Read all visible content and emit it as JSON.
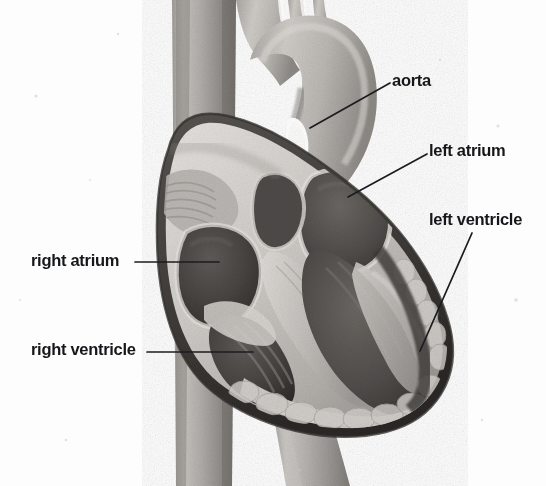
{
  "figure": {
    "kind": "anatomical-illustration",
    "style": "grayscale halftone scan",
    "background_color": "#fdfdfd",
    "text_color": "#16171a",
    "leader_line_color": "#1b1c1f"
  },
  "labels": [
    {
      "id": "aorta",
      "text": "aorta",
      "side": "right",
      "text_x": 392,
      "text_y": 72,
      "leader": {
        "x1": 390,
        "y1": 83,
        "x2": 310,
        "y2": 128
      }
    },
    {
      "id": "left-atrium",
      "text": "left atrium",
      "side": "right",
      "text_x": 429,
      "text_y": 142,
      "leader": {
        "x1": 427,
        "y1": 154,
        "x2": 348,
        "y2": 197
      }
    },
    {
      "id": "left-ventricle",
      "text": "left ventricle",
      "side": "right",
      "text_x": 429,
      "text_y": 211,
      "leader": {
        "x1": 472,
        "y1": 233,
        "x2": 420,
        "y2": 351
      }
    },
    {
      "id": "right-atrium",
      "text": "right atrium",
      "side": "left",
      "text_x": 31,
      "text_y": 252,
      "leader": {
        "x1": 135,
        "y1": 262,
        "x2": 219,
        "y2": 262
      }
    },
    {
      "id": "right-ventricle",
      "text": "right ventricle",
      "side": "left",
      "text_x": 31,
      "text_y": 341,
      "leader": {
        "x1": 147,
        "y1": 352,
        "x2": 253,
        "y2": 352
      }
    }
  ],
  "palette": {
    "tissue_light": "#d8d6d3",
    "tissue_mid": "#a8a5a1",
    "tissue_dark": "#6e6b68",
    "cavity_dark": "#4a4845",
    "cavity_darkest": "#343230",
    "wall_highlight": "#e8e6e3",
    "outline": "#2e2c2a"
  }
}
